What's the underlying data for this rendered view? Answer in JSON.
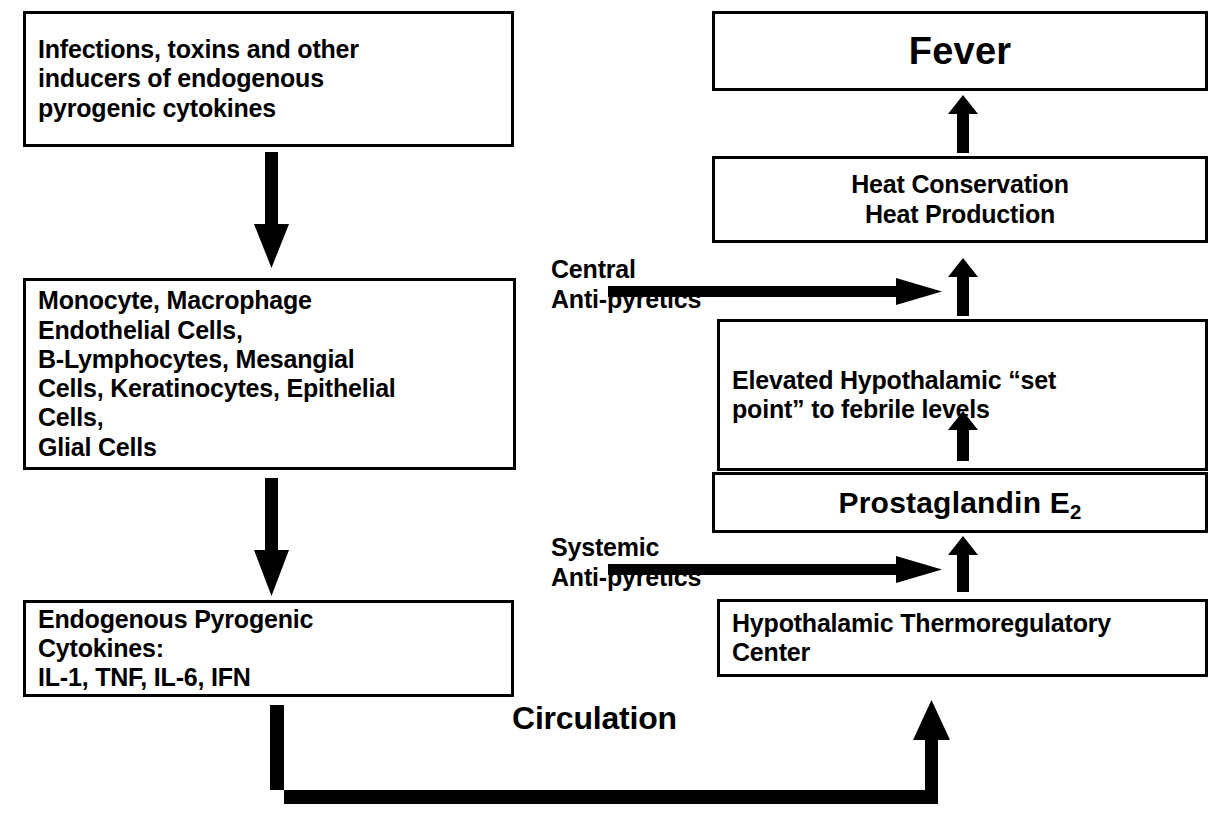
{
  "diagram": {
    "ink_color": "#000000",
    "background_color": "#ffffff",
    "nodes": {
      "inducers": "Infections, toxins and other\ninducers of endogenous\npyrogenic cytokines",
      "producing_cells": "Monocyte, Macrophage\nEndothelial Cells,\nB-Lymphocytes, Mesangial\nCells, Keratinocytes, Epithelial\nCells,\nGlial Cells",
      "endogenous_pyrogens": "Endogenous Pyrogenic\nCytokines:\nIL-1, TNF, IL-6, IFN",
      "fever": "Fever",
      "heat": "Heat Conservation\nHeat Production",
      "set_point": "Elevated Hypothalamic “set\npoint” to febrile levels",
      "prostaglandin_prefix": "Prostaglandin E",
      "prostaglandin_subscript": "2",
      "thermoregulatory_center": "Hypothalamic Thermoregulatory\nCenter"
    },
    "labels": {
      "central_antipyretics": "Central\nAnti-pyretics",
      "systemic_antipyretics": "Systemic\nAnti-pyretics",
      "circulation": "Circulation"
    },
    "edges": [
      {
        "name": "inducers-to-cells",
        "from": "inducers",
        "to": "producing_cells",
        "direction": "down"
      },
      {
        "name": "cells-to-pyrogens",
        "from": "producing_cells",
        "to": "endogenous_pyrogens",
        "direction": "down"
      },
      {
        "name": "pyrogens-to-thermoregulatory-center",
        "from": "endogenous_pyrogens",
        "to": "thermoregulatory_center",
        "direction": "circulation-loop",
        "label": "Circulation"
      },
      {
        "name": "center-to-prostaglandin",
        "from": "thermoregulatory_center",
        "to": "prostaglandin",
        "direction": "up"
      },
      {
        "name": "prostaglandin-to-setpoint",
        "from": "prostaglandin",
        "to": "set_point",
        "direction": "up"
      },
      {
        "name": "setpoint-to-heat",
        "from": "set_point",
        "to": "heat",
        "direction": "up"
      },
      {
        "name": "heat-to-fever",
        "from": "heat",
        "to": "fever",
        "direction": "up"
      },
      {
        "name": "central-antipyretics-block",
        "from": "central_antipyretics",
        "to": "setpoint-to-heat",
        "direction": "right"
      },
      {
        "name": "systemic-antipyretics-block",
        "from": "systemic_antipyretics",
        "to": "center-to-prostaglandin",
        "direction": "right"
      }
    ]
  }
}
